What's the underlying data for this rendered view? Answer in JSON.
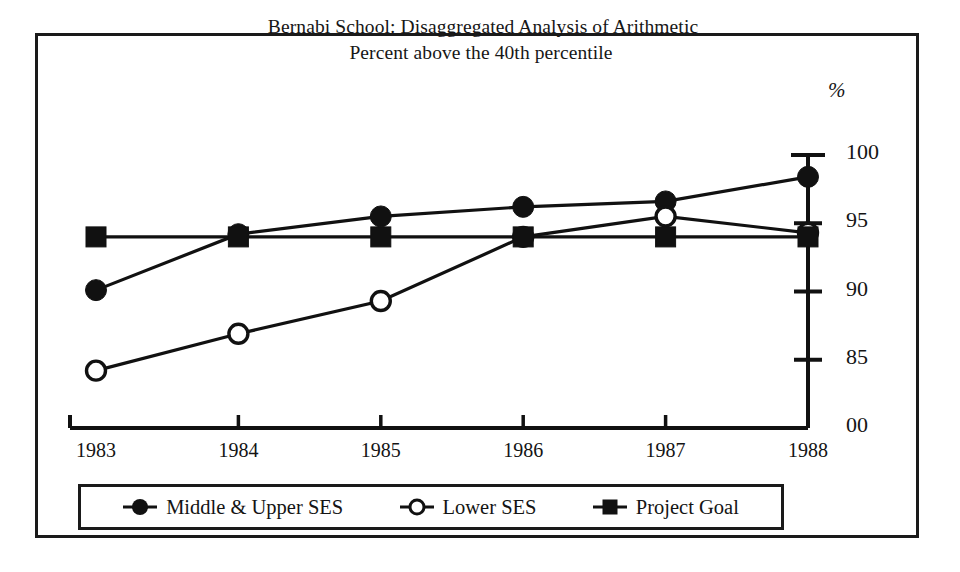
{
  "figure": {
    "percent_unit": "%"
  },
  "chart_data": {
    "type": "line",
    "title": "Bernabi School: Disaggregated Analysis of Arithmetic",
    "subtitle": "Percent above the 40th percentile",
    "title_lines": [
      "Bernabi School: Disaggregated Analysis of Arithmetic",
      "Percent above the 40th percentile"
    ],
    "xlabel": "",
    "ylabel": "%",
    "categories": [
      "1983",
      "1984",
      "1985",
      "1986",
      "1987",
      "1988"
    ],
    "x_tick_labels": [
      "1983",
      "1984",
      "1985",
      "1986",
      "1987",
      "1988"
    ],
    "y_tick_labels": [
      "100",
      "95",
      "90",
      "85",
      "00"
    ],
    "y_tick_values": [
      100,
      95,
      90,
      85,
      80
    ],
    "ylim": [
      80,
      101
    ],
    "grid": false,
    "legend_position": "bottom",
    "series": [
      {
        "name": "Middle & Upper SES",
        "marker": "filled-circle",
        "color": "#111111",
        "values": [
          90.1,
          94.2,
          95.5,
          96.2,
          96.6,
          98.4
        ]
      },
      {
        "name": "Lower SES",
        "marker": "open-circle",
        "color": "#111111",
        "values": [
          84.2,
          86.9,
          89.3,
          94.0,
          95.5,
          94.3
        ]
      },
      {
        "name": "Project Goal",
        "marker": "filled-square",
        "color": "#111111",
        "values": [
          94.0,
          94.0,
          94.0,
          94.0,
          94.0,
          94.0
        ]
      }
    ]
  },
  "legend": {
    "entries": [
      {
        "label": "Middle & Upper SES",
        "marker": "filled-circle"
      },
      {
        "label": "Lower SES",
        "marker": "open-circle"
      },
      {
        "label": "Project Goal",
        "marker": "filled-square"
      }
    ]
  }
}
